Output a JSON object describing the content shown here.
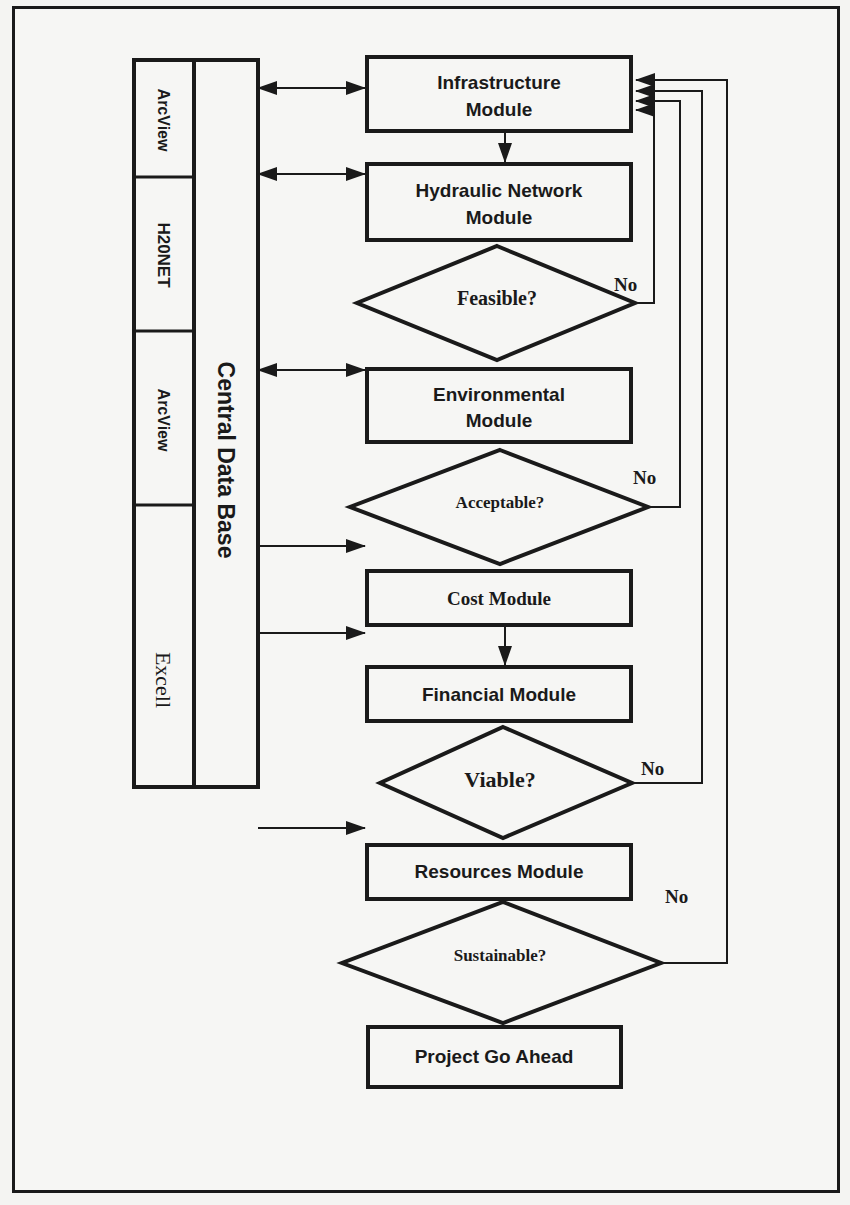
{
  "database": {
    "label": "Central Data Base",
    "tools": [
      {
        "label": "ArcView"
      },
      {
        "label": "H20NET"
      },
      {
        "label": "ArcView"
      },
      {
        "label": "Excell"
      }
    ]
  },
  "modules": {
    "infrastructure": {
      "line1": "Infrastructure",
      "line2": "Module"
    },
    "hydraulic": {
      "line1": "Hydraulic Network",
      "line2": "Module"
    },
    "environmental": {
      "line1": "Environmental",
      "line2": "Module"
    },
    "cost": {
      "label": "Cost Module"
    },
    "financial": {
      "label": "Financial Module"
    },
    "resources": {
      "label": "Resources Module"
    },
    "go_ahead": {
      "label": "Project Go Ahead"
    }
  },
  "decisions": {
    "feasible": {
      "label": "Feasible?",
      "no_label": "No"
    },
    "acceptable": {
      "label": "Acceptable?",
      "no_label": "No"
    },
    "viable": {
      "label": "Viable?",
      "no_label": "No"
    },
    "sustainable": {
      "label": "Sustainable?",
      "no_label": "No"
    }
  },
  "colors": {
    "stroke": "#1a1a1a",
    "background": "#f6f6f4"
  }
}
